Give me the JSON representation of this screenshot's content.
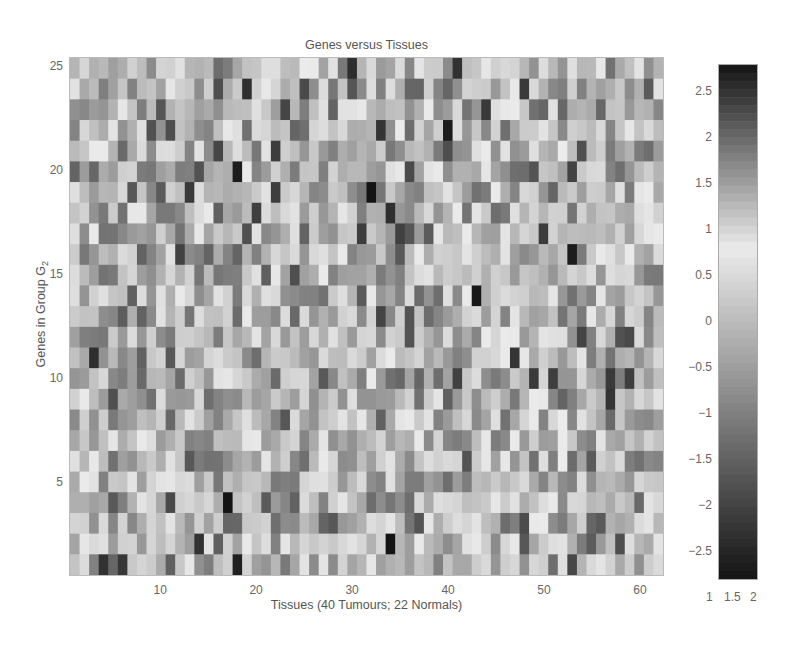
{
  "chart_data": {
    "type": "heatmap",
    "title": "Genes versus Tissues",
    "xlabel": "Tissues (40 Tumours; 22 Normals)",
    "ylabel": "Genes in Group G",
    "ylabel_subscript": "2",
    "n_cols": 62,
    "n_rows": 25,
    "xlim": [
      0.5,
      62.5
    ],
    "ylim": [
      0.5,
      25.5
    ],
    "xticks": [
      10,
      20,
      30,
      40,
      50,
      60
    ],
    "yticks": [
      5,
      10,
      15,
      20,
      25
    ],
    "colormap": "grayscale, dark at both extremes (-2.8 and +2.8), lightest near +0.8",
    "colorbar": {
      "ticks": [
        2.5,
        2,
        1.5,
        1,
        0.5,
        0,
        -0.5,
        -1,
        -1.5,
        -2,
        -2.5
      ],
      "tick_labels": [
        "2.5",
        "2",
        "1.5",
        "1",
        "0.5",
        "0",
        "-0.5",
        "-1",
        "-1.5",
        "-2",
        "-2.5"
      ],
      "range": [
        -2.8,
        2.8
      ],
      "x_ticks": [
        "1",
        "1.5",
        "2"
      ]
    },
    "grid": false,
    "legend": "colorbar right",
    "note": "cell values estimated from grayscale intensity; rows listed top (gene 25) to bottom (gene 1)",
    "values": []
  },
  "labels": {
    "title": "Genes versus Tissues",
    "xlabel": "Tissues (40 Tumours; 22 Normals)",
    "ylabel_main": "Genes in Group G",
    "ylabel_sub": "2"
  }
}
